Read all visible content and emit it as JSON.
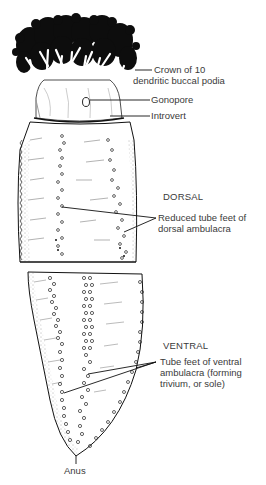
{
  "figure": {
    "colors": {
      "ink": "#111111",
      "label_text": "#3a3a3a",
      "background": "#ffffff"
    }
  },
  "views": {
    "dorsal": {
      "title": "DORSAL"
    },
    "ventral": {
      "title": "VENTRAL"
    }
  },
  "labels": {
    "crown": {
      "line1": "Crown of 10",
      "line2": "dendritic buccal podia"
    },
    "gonopore": {
      "text": "Gonopore"
    },
    "introvert": {
      "text": "Introvert"
    },
    "dorsal_feet": {
      "line1": "Reduced tube feet of",
      "line2": "dorsal ambulacra"
    },
    "ventral_feet": {
      "line1": "Tube feet of ventral",
      "line2": "ambulacra (forming",
      "line3": "trivium, or sole)"
    },
    "anus": {
      "text": "Anus"
    }
  }
}
